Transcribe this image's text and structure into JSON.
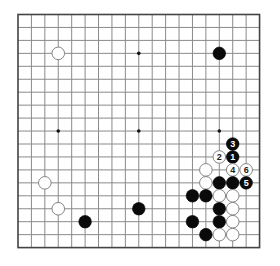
{
  "board": {
    "size": 19,
    "origin": {
      "x": 18,
      "y": 14.5
    },
    "spacing": {
      "x": 13.42,
      "y": 12.95
    },
    "line_color": "#8a8a8a",
    "border_color": "#444444",
    "hoshi": [
      [
        3,
        9
      ],
      [
        9,
        3
      ],
      [
        9,
        9
      ],
      [
        15,
        9
      ]
    ],
    "hoshi_color": "#111111"
  },
  "stones": [
    {
      "color": "white",
      "col": 3,
      "row": 3
    },
    {
      "color": "black",
      "col": 15,
      "row": 3
    },
    {
      "color": "white",
      "col": 2,
      "row": 13
    },
    {
      "color": "white",
      "col": 3,
      "row": 15
    },
    {
      "color": "black",
      "col": 5,
      "row": 16
    },
    {
      "color": "black",
      "col": 9,
      "row": 15
    },
    {
      "color": "black",
      "col": 16,
      "row": 10,
      "label": "3"
    },
    {
      "color": "white",
      "col": 15,
      "row": 11,
      "label": "2"
    },
    {
      "color": "black",
      "col": 16,
      "row": 11,
      "label": "1"
    },
    {
      "color": "white",
      "col": 14,
      "row": 12
    },
    {
      "color": "white",
      "col": 16,
      "row": 12,
      "label": "4"
    },
    {
      "color": "white",
      "col": 17,
      "row": 12,
      "label": "6"
    },
    {
      "color": "white",
      "col": 14,
      "row": 13
    },
    {
      "color": "black",
      "col": 15,
      "row": 13
    },
    {
      "color": "black",
      "col": 16,
      "row": 13
    },
    {
      "color": "black",
      "col": 17,
      "row": 13,
      "label": "5"
    },
    {
      "color": "black",
      "col": 13,
      "row": 14
    },
    {
      "color": "black",
      "col": 14,
      "row": 14
    },
    {
      "color": "white",
      "col": 15,
      "row": 14
    },
    {
      "color": "white",
      "col": 16,
      "row": 14
    },
    {
      "color": "black",
      "col": 15,
      "row": 15
    },
    {
      "color": "white",
      "col": 16,
      "row": 15
    },
    {
      "color": "black",
      "col": 13,
      "row": 16
    },
    {
      "color": "black",
      "col": 15,
      "row": 16
    },
    {
      "color": "white",
      "col": 16,
      "row": 16
    },
    {
      "color": "black",
      "col": 14,
      "row": 17
    },
    {
      "color": "white",
      "col": 15,
      "row": 17
    },
    {
      "color": "white",
      "col": 16,
      "row": 17
    }
  ]
}
